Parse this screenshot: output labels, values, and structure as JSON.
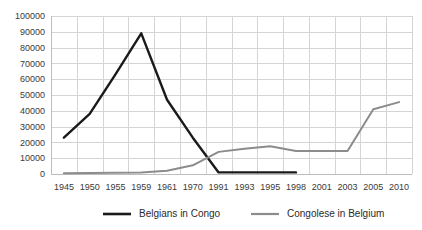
{
  "chart_data": {
    "type": "line",
    "title": "",
    "xlabel": "",
    "ylabel": "",
    "categories": [
      "1945",
      "1950",
      "1955",
      "1959",
      "1961",
      "1970",
      "1991",
      "1993",
      "1995",
      "1998",
      "2001",
      "2003",
      "2005",
      "2010"
    ],
    "ylim": [
      0,
      100000
    ],
    "ytick_values": [
      0,
      10000,
      20000,
      30000,
      40000,
      50000,
      60000,
      70000,
      80000,
      90000,
      100000
    ],
    "ytick_labels": [
      "0",
      "10000",
      "20000",
      "30000",
      "40000",
      "50000",
      "60000",
      "70000",
      "80000",
      "90000",
      "100000"
    ],
    "grid": true,
    "legend_position": "bottom",
    "series": [
      {
        "name": "Belgians in Congo",
        "color": "#1a1a1a",
        "values": [
          23000,
          38000,
          63000,
          89000,
          47000,
          23000,
          1000,
          1000,
          1000,
          1000,
          null,
          null,
          null,
          null
        ]
      },
      {
        "name": "Congolese in Belgium",
        "color": "#8c8c8c",
        "values": [
          500,
          600,
          800,
          900,
          2000,
          5500,
          14000,
          16000,
          17500,
          14500,
          14500,
          14500,
          41000,
          45500
        ]
      }
    ]
  },
  "legend": {
    "items": [
      {
        "label": "Belgians in Congo",
        "color": "#1a1a1a"
      },
      {
        "label": "Congolese in Belgium",
        "color": "#8c8c8c"
      }
    ]
  }
}
